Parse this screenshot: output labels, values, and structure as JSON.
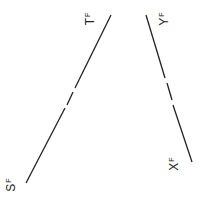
{
  "diagram": {
    "labels": [
      {
        "id": "T",
        "main": "T",
        "sub": "F"
      },
      {
        "id": "Y",
        "main": "Y",
        "sub": "F"
      },
      {
        "id": "S",
        "main": "S",
        "sub": "F"
      },
      {
        "id": "X",
        "main": "X",
        "sub": "F"
      }
    ],
    "lines": [
      {
        "name": "line-s-t",
        "from": "S",
        "to": "T",
        "segments": [
          [
            111,
            15,
            75,
            88
          ],
          [
            73,
            92,
            67,
            105
          ],
          [
            65,
            108,
            26,
            183
          ]
        ]
      },
      {
        "name": "line-y-x",
        "from": "Y",
        "to": "X",
        "segments": [
          [
            146,
            15,
            165,
            78
          ],
          [
            167,
            83,
            172,
            100
          ],
          [
            173,
            105,
            192,
            162
          ]
        ]
      }
    ],
    "stroke_color": "#222222"
  }
}
